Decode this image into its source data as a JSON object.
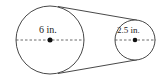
{
  "diagram": {
    "large_pulley": {
      "label": "6 in.",
      "cx": 50,
      "cy": 40,
      "r": 34
    },
    "small_pulley": {
      "label": "2.5 in.",
      "cx": 135,
      "cy": 40,
      "r": 20
    },
    "colors": {
      "stroke": "#333333",
      "dash": "#444444",
      "dot": "#111111"
    }
  }
}
